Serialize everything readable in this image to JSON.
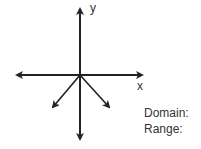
{
  "graph": {
    "y_axis_label": "y",
    "x_axis_label": "x",
    "arrows": [
      {
        "name": "positive-y-axis-arrow",
        "direction": "up"
      },
      {
        "name": "negative-y-axis-arrow",
        "direction": "down"
      },
      {
        "name": "positive-x-axis-arrow",
        "direction": "right"
      },
      {
        "name": "negative-x-axis-arrow",
        "direction": "left"
      },
      {
        "name": "lower-left-ray-arrow",
        "direction": "down-left"
      },
      {
        "name": "lower-right-ray-arrow",
        "direction": "down-right"
      }
    ]
  },
  "answers": {
    "domain_label": "Domain:",
    "range_label": "Range:"
  }
}
